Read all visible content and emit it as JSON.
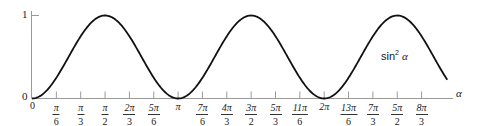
{
  "chart_data": {
    "type": "line",
    "title": "",
    "function": "sin^2(alpha)",
    "series": [
      {
        "name": "sin² α",
        "x": [
          0,
          0.5236,
          1.0472,
          1.5708,
          2.0944,
          2.618,
          3.1416,
          3.6652,
          4.1888,
          4.7124,
          5.236,
          5.7596,
          6.2832,
          6.8068,
          7.3304,
          7.854,
          8.3776,
          8.93
        ],
        "values": [
          0,
          0.25,
          0.75,
          1,
          0.75,
          0.25,
          0,
          0.25,
          0.75,
          1,
          0.75,
          0.25,
          0,
          0.25,
          0.75,
          1,
          0.75,
          0.23
        ]
      }
    ],
    "xlabel": "α",
    "ylabel": "",
    "xlim": [
      0,
      8.93
    ],
    "ylim": [
      0,
      1
    ],
    "yticks": [
      "0",
      "1"
    ],
    "xticks": [
      "0",
      "π/6",
      "π/3",
      "π/2",
      "2π/3",
      "5π/6",
      "π",
      "7π/6",
      "4π/3",
      "3π/2",
      "5π/3",
      "11π/6",
      "2π",
      "13π/6",
      "7π/3",
      "5π/2",
      "8π/3"
    ],
    "annotations": [
      "sin² α"
    ],
    "grid": false,
    "legend": "none"
  },
  "labels": {
    "curve_label_base": "sin",
    "curve_label_exp": "2",
    "curve_label_var": "α",
    "x_axis_label": "α",
    "y_one": "1",
    "y_zero": "0",
    "x_zero": "0"
  },
  "ticks": [
    {
      "kind": "frac",
      "num": "π",
      "den": "6",
      "k": 1
    },
    {
      "kind": "frac",
      "num": "π",
      "den": "3",
      "k": 2
    },
    {
      "kind": "frac",
      "num": "π",
      "den": "2",
      "k": 3
    },
    {
      "kind": "frac",
      "num": "2π",
      "den": "3",
      "k": 4
    },
    {
      "kind": "frac",
      "num": "5π",
      "den": "6",
      "k": 5
    },
    {
      "kind": "single",
      "text": "π",
      "k": 6
    },
    {
      "kind": "frac",
      "num": "7π",
      "den": "6",
      "k": 7
    },
    {
      "kind": "frac",
      "num": "4π",
      "den": "3",
      "k": 8
    },
    {
      "kind": "frac",
      "num": "3π",
      "den": "2",
      "k": 9
    },
    {
      "kind": "frac",
      "num": "5π",
      "den": "3",
      "k": 10
    },
    {
      "kind": "frac",
      "num": "11π",
      "den": "6",
      "k": 11
    },
    {
      "kind": "single",
      "text": "2π",
      "k": 12
    },
    {
      "kind": "frac",
      "num": "13π",
      "den": "6",
      "k": 13
    },
    {
      "kind": "frac",
      "num": "7π",
      "den": "3",
      "k": 14
    },
    {
      "kind": "frac",
      "num": "5π",
      "den": "2",
      "k": 15
    },
    {
      "kind": "frac",
      "num": "8π",
      "den": "3",
      "k": 16
    }
  ],
  "colors": {
    "curve": "#111111",
    "axis": "#9a9a9a",
    "text": "#1a1a1a"
  }
}
